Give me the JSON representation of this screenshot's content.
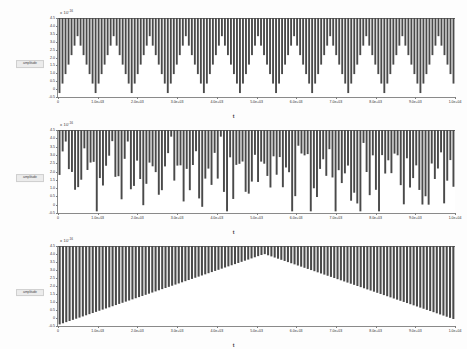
{
  "figure": {
    "background": "#fdfdfd",
    "bar_color": "#4a4a4a",
    "axis_color": "#8a8a8a",
    "panel_count": 3
  },
  "chart_data": [
    {
      "type": "bar",
      "title": "",
      "xlabel": "t",
      "ylabel": "amplitude",
      "y_exponent_label": "x 10",
      "y_exponent_power": "-16",
      "xlim": [
        0,
        1.0
      ],
      "ylim": [
        -0.5,
        4.5
      ],
      "grid": false,
      "legend": "none",
      "xticks": [
        "0",
        "1.0e+03",
        "2.0e+03",
        "3.0e+03",
        "4.0e+03",
        "5.0e+03",
        "6.0e+03",
        "7.0e+03",
        "8.0e+03",
        "9.0e+03",
        "1.0e+04"
      ],
      "yticks": [
        "4.5",
        "4.0",
        "3.5",
        "3.0",
        "2.5",
        "2.0",
        "1.5",
        "1.0",
        "0.5",
        "0",
        "-0.5"
      ],
      "pattern": "periodic-sawtooth",
      "period_bars": 12,
      "bar_count": 132,
      "description": "Regular triangular sawtooth envelope, 11 repeating periods, bars rise from baseline to full scale then reset"
    },
    {
      "type": "bar",
      "title": "",
      "xlabel": "t",
      "ylabel": "amplitude",
      "y_exponent_label": "x 10",
      "y_exponent_power": "-16",
      "xlim": [
        0,
        1.0
      ],
      "ylim": [
        -0.5,
        4.5
      ],
      "grid": false,
      "legend": "none",
      "xticks": [
        "0",
        "1.0e+03",
        "2.0e+03",
        "3.0e+03",
        "4.0e+03",
        "5.0e+03",
        "6.0e+03",
        "7.0e+03",
        "8.0e+03",
        "9.0e+03",
        "1.0e+04"
      ],
      "yticks": [
        "4.5",
        "4.0",
        "3.5",
        "3.0",
        "2.5",
        "2.0",
        "1.5",
        "1.0",
        "0.5",
        "0",
        "-0.5"
      ],
      "pattern": "irregular-chaotic",
      "bar_count": 128,
      "description": "Irregular non-periodic bar heights, all bars reach the top rail with pseudo-random lower extents"
    },
    {
      "type": "bar",
      "title": "",
      "xlabel": "t",
      "ylabel": "amplitude",
      "y_exponent_label": "x 10",
      "y_exponent_power": "-16",
      "xlim": [
        0,
        1.0
      ],
      "ylim": [
        -0.5,
        4.5
      ],
      "grid": false,
      "legend": "none",
      "xticks": [
        "0",
        "1.0e+03",
        "2.0e+03",
        "3.0e+03",
        "4.0e+03",
        "5.0e+03",
        "6.0e+03",
        "7.0e+03",
        "8.0e+03",
        "9.0e+03",
        "1.0e+04"
      ],
      "yticks": [
        "4.5",
        "4.0",
        "3.5",
        "3.0",
        "2.5",
        "2.0",
        "1.5",
        "1.0",
        "0.5",
        "0",
        "-0.5"
      ],
      "pattern": "hourglass-bowtie",
      "bar_count": 120,
      "description": "Bars converge linearly toward a narrow waist near the centre then diverge again, forming a bowtie envelope"
    }
  ]
}
